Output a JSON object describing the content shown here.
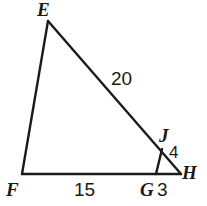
{
  "figure": {
    "background_color": "#ffffff",
    "stroke_color": "#1a1a1a",
    "text_color": "#1a1a1a",
    "vertex_labels": {
      "E": "E",
      "F": "F",
      "G": "G",
      "H": "H",
      "J": "J"
    },
    "measure_labels": {
      "EJ": "20",
      "FG": "15",
      "GH": "3",
      "JH": "4"
    }
  },
  "chart_data": {
    "type": "diagram",
    "points": {
      "E": [
        48,
        21
      ],
      "F": [
        22,
        174
      ],
      "G": [
        156,
        174
      ],
      "H": [
        181,
        174
      ],
      "J": [
        162,
        149
      ]
    },
    "segments": [
      {
        "name": "EF",
        "from": "E",
        "to": "F"
      },
      {
        "name": "EH",
        "from": "E",
        "to": "H"
      },
      {
        "name": "FH",
        "from": "F",
        "to": "H"
      },
      {
        "name": "JG",
        "from": "J",
        "to": "G"
      }
    ],
    "labeled_lengths": [
      {
        "segment": "EJ",
        "value": 20
      },
      {
        "segment": "FG",
        "value": 15
      },
      {
        "segment": "GH",
        "value": 3
      },
      {
        "segment": "JH",
        "value": 4
      }
    ],
    "xlabel": "",
    "ylabel": "",
    "grid": false,
    "legend": false
  }
}
